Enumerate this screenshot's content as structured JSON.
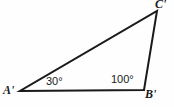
{
  "figure": {
    "kind": "geometry-triangle-diagram",
    "canvas": {
      "width": 174,
      "height": 107,
      "background": "#fefefe"
    },
    "stroke_color": "#1a1a1a",
    "stroke_width": 2,
    "vertices": [
      {
        "id": "A",
        "label": "A'",
        "x": 20,
        "y": 91
      },
      {
        "id": "B",
        "label": "B'",
        "x": 144,
        "y": 90
      },
      {
        "id": "C",
        "label": "C'",
        "x": 157,
        "y": 11
      }
    ],
    "edges": [
      {
        "from": "A",
        "to": "B"
      },
      {
        "from": "A",
        "to": "C"
      },
      {
        "from": "B",
        "to": "C"
      }
    ],
    "angles": [
      {
        "at": "A",
        "label": "30°",
        "value": 30
      },
      {
        "at": "B",
        "label": "100°",
        "value": 100
      }
    ]
  },
  "labels": {
    "vertex_a": "A'",
    "vertex_b": "B'",
    "vertex_c": "C'",
    "angle_a": "30°",
    "angle_b": "100°"
  }
}
